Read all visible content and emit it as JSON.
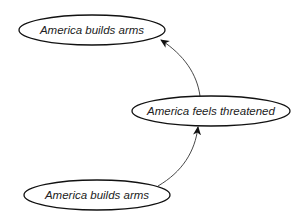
{
  "diagram": {
    "type": "causal-loop",
    "nodes": [
      {
        "id": "n1",
        "label": "America builds arms",
        "cx": 92,
        "cy": 30,
        "rx": 73,
        "ry": 15
      },
      {
        "id": "n2",
        "label": "America feels threatened",
        "cx": 211,
        "cy": 111,
        "rx": 79,
        "ry": 15
      },
      {
        "id": "n3",
        "label": "America builds arms",
        "cx": 97,
        "cy": 195,
        "rx": 73,
        "ry": 15
      }
    ],
    "edges": [
      {
        "from": "n3",
        "to": "n2"
      },
      {
        "from": "n2",
        "to": "n1"
      }
    ],
    "colors": {
      "stroke": "#111111",
      "text": "#222222",
      "background": "#ffffff"
    }
  }
}
